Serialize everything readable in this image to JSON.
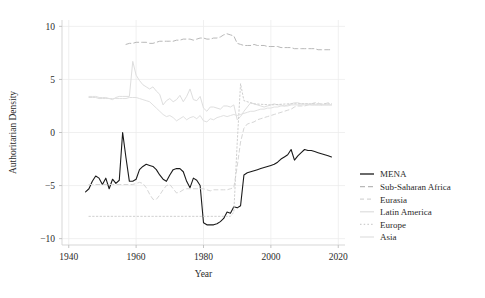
{
  "chart_data": {
    "type": "line",
    "title": "",
    "xlabel": "Year",
    "ylabel": "Authoritarian Density",
    "xlim": [
      1938,
      2022
    ],
    "ylim": [
      -10.6,
      10.6
    ],
    "xticks": [
      1940,
      1960,
      1980,
      2000,
      2020
    ],
    "xtick_labels": [
      "1940",
      "1960",
      "1980",
      "2000",
      "2020"
    ],
    "yticks": [
      10,
      5,
      0,
      -5,
      -10
    ],
    "ytick_labels": [
      "10",
      "5",
      "0",
      "-5",
      "-10"
    ],
    "grid": true,
    "legend_position": "right",
    "series": [
      {
        "name": "MENA",
        "color": "#1a1a1a",
        "dash": "none",
        "width": 1.1,
        "x": [
          1945,
          1946,
          1947,
          1948,
          1949,
          1950,
          1951,
          1952,
          1953,
          1954,
          1955,
          1956,
          1957,
          1958,
          1959,
          1960,
          1961,
          1962,
          1963,
          1964,
          1965,
          1966,
          1967,
          1968,
          1969,
          1970,
          1971,
          1972,
          1973,
          1974,
          1975,
          1976,
          1977,
          1978,
          1979,
          1980,
          1981,
          1982,
          1983,
          1984,
          1985,
          1986,
          1987,
          1988,
          1989,
          1990,
          1991,
          1992,
          1993,
          1994,
          1995,
          1996,
          1997,
          1998,
          1999,
          2000,
          2001,
          2002,
          2003,
          2004,
          2005,
          2006,
          2007,
          2008,
          2009,
          2010,
          2011,
          2012,
          2013,
          2014,
          2015,
          2016,
          2017,
          2018
        ],
        "values": [
          -5.6,
          -5.3,
          -4.6,
          -4.1,
          -4.3,
          -4.9,
          -4.3,
          -5.3,
          -4.4,
          -4.8,
          -4.5,
          0.0,
          -2.4,
          -4.6,
          -4.6,
          -4.4,
          -3.5,
          -3.2,
          -3.0,
          -3.1,
          -3.2,
          -3.5,
          -4.0,
          -4.4,
          -4.6,
          -4.0,
          -3.5,
          -3.4,
          -3.4,
          -3.7,
          -4.6,
          -5.2,
          -4.3,
          -4.5,
          -5.0,
          -8.5,
          -8.7,
          -8.7,
          -8.7,
          -8.6,
          -8.4,
          -8.1,
          -7.5,
          -7.6,
          -7.0,
          -7.1,
          -6.9,
          -4.0,
          -3.8,
          -3.7,
          -3.6,
          -3.5,
          -3.4,
          -3.3,
          -3.2,
          -3.1,
          -3.0,
          -2.8,
          -2.5,
          -2.3,
          -2.1,
          -1.6,
          -2.6,
          -2.2,
          -1.9,
          -1.6,
          -1.7,
          -1.7,
          -1.8,
          -1.9,
          -2.0,
          -2.1,
          -2.2,
          -2.3
        ]
      },
      {
        "name": "Sub-Saharan Africa",
        "color": "#b8b8b8",
        "dash": "5,3",
        "width": 1.0,
        "x": [
          1957,
          1958,
          1959,
          1960,
          1961,
          1962,
          1963,
          1964,
          1965,
          1966,
          1967,
          1968,
          1969,
          1970,
          1971,
          1972,
          1973,
          1974,
          1975,
          1976,
          1977,
          1978,
          1979,
          1980,
          1981,
          1982,
          1983,
          1984,
          1985,
          1986,
          1987,
          1988,
          1989,
          1990,
          1991,
          1992,
          1993,
          1994,
          1995,
          1996,
          1997,
          1998,
          1999,
          2000,
          2001,
          2002,
          2003,
          2004,
          2005,
          2006,
          2007,
          2008,
          2009,
          2010,
          2011,
          2012,
          2013,
          2014,
          2015,
          2016,
          2017,
          2018
        ],
        "values": [
          8.3,
          8.4,
          8.4,
          8.5,
          8.5,
          8.5,
          8.5,
          8.4,
          8.4,
          8.5,
          8.6,
          8.6,
          8.6,
          8.6,
          8.6,
          8.7,
          8.7,
          8.8,
          8.8,
          8.8,
          8.7,
          8.8,
          8.9,
          8.9,
          8.8,
          8.8,
          8.9,
          8.9,
          9.0,
          9.2,
          9.3,
          9.2,
          9.1,
          8.4,
          8.3,
          8.2,
          8.2,
          8.2,
          8.3,
          8.2,
          8.2,
          8.2,
          8.1,
          8.1,
          8.1,
          8.1,
          8.0,
          8.0,
          8.0,
          8.0,
          7.9,
          7.9,
          7.9,
          7.9,
          7.9,
          7.9,
          7.9,
          7.8,
          7.8,
          7.8,
          7.8,
          7.8
        ]
      },
      {
        "name": "Eurasia",
        "color": "#d6d6d6",
        "dash": "4,3",
        "width": 1.0,
        "x": [
          1946,
          1947,
          1948,
          1949,
          1950,
          1951,
          1952,
          1953,
          1954,
          1955,
          1956,
          1957,
          1958,
          1959,
          1960,
          1961,
          1962,
          1963,
          1964,
          1965,
          1966,
          1967,
          1968,
          1969,
          1970,
          1971,
          1972,
          1973,
          1974,
          1975,
          1976,
          1977,
          1978,
          1979,
          1980,
          1981,
          1982,
          1983,
          1984,
          1985,
          1986,
          1987,
          1988,
          1989,
          1990,
          1991,
          1992,
          1993,
          1994,
          1995,
          1996,
          1997,
          1998,
          1999,
          2000,
          2001,
          2002,
          2003,
          2004,
          2005,
          2006,
          2007,
          2008,
          2009,
          2010,
          2011,
          2012,
          2013,
          2014,
          2015,
          2016,
          2017,
          2018
        ],
        "values": [
          -4.9,
          -4.9,
          -4.9,
          -4.9,
          -4.9,
          -4.9,
          -4.9,
          -4.9,
          -4.9,
          -4.9,
          -4.9,
          -4.9,
          -4.9,
          -4.9,
          -4.8,
          -4.7,
          -4.8,
          -5.2,
          -5.8,
          -6.3,
          -6.3,
          -5.9,
          -5.4,
          -5.0,
          -4.9,
          -5.3,
          -5.7,
          -5.6,
          -5.4,
          -5.3,
          -5.3,
          -5.3,
          -5.3,
          -5.3,
          -5.3,
          -5.4,
          -5.5,
          -5.4,
          -5.4,
          -5.4,
          -5.4,
          -5.4,
          -5.3,
          -5.2,
          -3.2,
          -0.9,
          0.4,
          0.8,
          0.9,
          1.0,
          1.2,
          1.3,
          1.4,
          1.5,
          1.6,
          1.7,
          1.8,
          1.9,
          2.0,
          2.1,
          2.2,
          2.4,
          2.5,
          2.5,
          2.5,
          2.6,
          2.7,
          2.8,
          2.8,
          2.6,
          2.7,
          2.8,
          2.7
        ]
      },
      {
        "name": "Latin America",
        "color": "#dedede",
        "dash": "none",
        "width": 1.0,
        "x": [
          1946,
          1947,
          1948,
          1949,
          1950,
          1951,
          1952,
          1953,
          1954,
          1955,
          1956,
          1957,
          1958,
          1959,
          1960,
          1961,
          1962,
          1963,
          1964,
          1965,
          1966,
          1967,
          1968,
          1969,
          1970,
          1971,
          1972,
          1973,
          1974,
          1975,
          1976,
          1977,
          1978,
          1979,
          1980,
          1981,
          1982,
          1983,
          1984,
          1985,
          1986,
          1987,
          1988,
          1989,
          1990,
          1991,
          1992,
          1993,
          1994,
          1995,
          1996,
          1997,
          1998,
          1999,
          2000,
          2001,
          2002,
          2003,
          2004,
          2005,
          2006,
          2007,
          2008,
          2009,
          2010,
          2011,
          2012,
          2013,
          2014,
          2015,
          2016,
          2017,
          2018
        ],
        "values": [
          3.3,
          3.3,
          3.3,
          3.2,
          3.2,
          3.2,
          3.2,
          3.1,
          3.3,
          3.4,
          3.4,
          3.4,
          3.4,
          6.7,
          5.4,
          4.9,
          4.5,
          4.3,
          4.1,
          4.3,
          3.9,
          3.6,
          2.6,
          3.0,
          3.2,
          2.9,
          3.1,
          3.5,
          2.9,
          3.4,
          4.1,
          3.1,
          3.0,
          3.4,
          2.3,
          2.0,
          2.4,
          2.4,
          2.3,
          2.2,
          2.5,
          2.5,
          2.4,
          2.6,
          1.2,
          1.5,
          2.0,
          2.4,
          2.8,
          2.7,
          2.6,
          2.5,
          2.4,
          2.5,
          2.6,
          2.7,
          2.6,
          2.6,
          2.5,
          2.6,
          2.7,
          2.8,
          2.8,
          2.7,
          2.7,
          2.7,
          2.6,
          2.6,
          2.6,
          2.6,
          2.6,
          2.6,
          2.6
        ]
      },
      {
        "name": "Europe",
        "color": "#cfcfcf",
        "dash": "1.5,2.2",
        "width": 1.0,
        "x": [
          1946,
          1950,
          1955,
          1960,
          1965,
          1970,
          1975,
          1980,
          1985,
          1988,
          1989,
          1990,
          1991,
          1992,
          1995,
          2000,
          2005,
          2010,
          2015,
          2018
        ],
        "values": [
          -7.9,
          -7.9,
          -7.9,
          -7.9,
          -7.9,
          -7.9,
          -7.9,
          -7.9,
          -7.9,
          -7.9,
          -7.5,
          -1.0,
          4.6,
          3.0,
          2.7,
          2.6,
          2.7,
          2.7,
          2.7,
          2.7
        ]
      },
      {
        "name": "Asia",
        "color": "#e0e0e0",
        "dash": "none",
        "width": 1.0,
        "x": [
          1946,
          1947,
          1948,
          1949,
          1950,
          1951,
          1952,
          1953,
          1954,
          1955,
          1956,
          1957,
          1958,
          1959,
          1960,
          1961,
          1962,
          1963,
          1964,
          1965,
          1966,
          1967,
          1968,
          1969,
          1970,
          1971,
          1972,
          1973,
          1974,
          1975,
          1976,
          1977,
          1978,
          1979,
          1980,
          1981,
          1982,
          1983,
          1984,
          1985,
          1986,
          1987,
          1988,
          1989,
          1990,
          1991,
          1992,
          1993,
          1994,
          1995,
          1996,
          1997,
          1998,
          1999,
          2000,
          2001,
          2002,
          2003,
          2004,
          2005,
          2006,
          2007,
          2008,
          2009,
          2010,
          2011,
          2012,
          2013,
          2014,
          2015,
          2016,
          2017,
          2018
        ],
        "values": [
          3.4,
          3.4,
          3.4,
          3.3,
          3.3,
          3.3,
          3.2,
          3.2,
          3.2,
          3.2,
          3.2,
          3.2,
          3.3,
          3.3,
          3.3,
          3.2,
          3.1,
          3.0,
          2.9,
          2.6,
          2.3,
          2.0,
          1.7,
          1.5,
          1.6,
          1.4,
          1.1,
          1.3,
          1.5,
          1.2,
          1.4,
          1.5,
          1.3,
          1.6,
          1.1,
          1.0,
          1.3,
          1.2,
          1.4,
          1.5,
          1.6,
          1.5,
          1.6,
          1.7,
          1.6,
          1.7,
          1.8,
          1.9,
          2.0,
          2.0,
          2.1,
          2.2,
          2.2,
          2.3,
          2.3,
          2.4,
          2.4,
          2.5,
          2.5,
          2.5,
          2.6,
          2.6,
          2.6,
          2.6,
          2.6,
          2.6,
          2.6,
          2.6,
          2.6,
          2.6,
          2.6,
          2.6,
          2.6
        ]
      }
    ]
  },
  "legend": {
    "items": [
      {
        "label": "MENA"
      },
      {
        "label": "Sub-Saharan Africa"
      },
      {
        "label": "Eurasia"
      },
      {
        "label": "Latin America"
      },
      {
        "label": "Europe"
      },
      {
        "label": "Asia"
      }
    ]
  }
}
